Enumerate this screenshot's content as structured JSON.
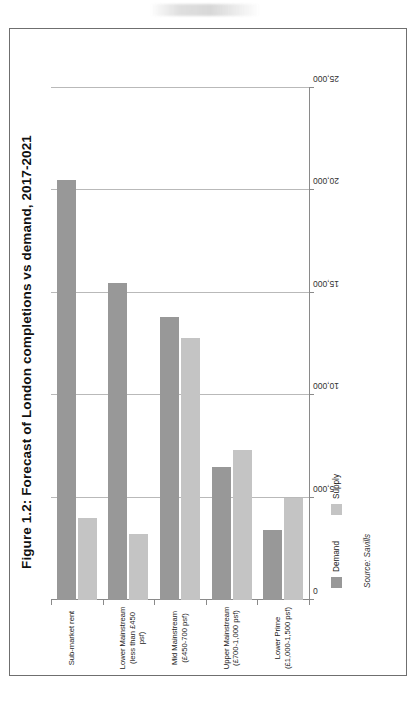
{
  "figure": {
    "title": "Figure 1.2: Forecast of London completions vs demand, 2017-2021",
    "source": "Source: Savills"
  },
  "legend": {
    "items": [
      {
        "label": "Demand",
        "color": "#989898"
      },
      {
        "label": "Supply",
        "color": "#c4c4c4"
      }
    ]
  },
  "axis": {
    "x_ticks": [
      "0",
      "5,000",
      "10,000",
      "15,000",
      "20,000",
      "25,000"
    ],
    "categories": [
      {
        "line1": "Sub-market rent",
        "line2": ""
      },
      {
        "line1": "Lower Mainstream",
        "line2": "(less than £450 psf)"
      },
      {
        "line1": "Mid Mainstream",
        "line2": "(£450-700 psf)"
      },
      {
        "line1": "Upper Mainstream",
        "line2": "(£700-1,000 psf)"
      },
      {
        "line1": "Lower Prime",
        "line2": "(£1,000-1,500 psf)"
      }
    ]
  },
  "chart_data": {
    "type": "bar",
    "orientation": "horizontal",
    "title": "Figure 1.2: Forecast of London completions vs demand, 2017-2021",
    "xlabel": "",
    "ylabel": "",
    "xlim": [
      0,
      25000
    ],
    "grid": true,
    "legend_position": "bottom-left",
    "categories": [
      "Sub-market rent",
      "Lower Mainstream (less than £450 psf)",
      "Mid Mainstream (£450-700 psf)",
      "Upper Mainstream (£700-1,000 psf)",
      "Lower Prime (£1,000-1,500 psf)"
    ],
    "series": [
      {
        "name": "Demand",
        "color": "#989898",
        "values": [
          20500,
          15500,
          13800,
          6500,
          3400
        ]
      },
      {
        "name": "Supply",
        "color": "#c4c4c4",
        "values": [
          4000,
          3200,
          12800,
          7300,
          5000
        ]
      }
    ],
    "tick_labels": [
      "0",
      "5,000",
      "10,000",
      "15,000",
      "20,000",
      "25,000"
    ],
    "tick_values": [
      0,
      5000,
      10000,
      15000,
      20000,
      25000
    ],
    "source": "Source: Savills"
  }
}
